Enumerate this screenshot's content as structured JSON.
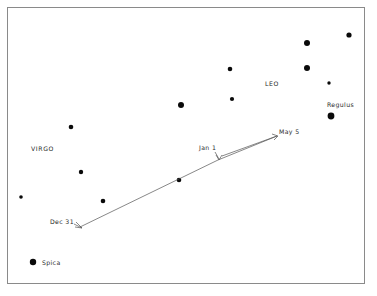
{
  "figure": {
    "background_color": "#ffffff",
    "frame_color": "#8a8a8a",
    "star_color": "#0a0a0a",
    "path_color": "#555555",
    "label_color": "#2b2b2b"
  },
  "frame": {
    "x": 7.5,
    "y": 7.5,
    "width": 357,
    "height": 276
  },
  "constellations": [
    {
      "name": "LEO",
      "label": "LEO",
      "x": 265,
      "y": 86
    },
    {
      "name": "VIRGO",
      "label": "VIRGO",
      "x": 31,
      "y": 151
    }
  ],
  "named_stars": [
    {
      "name": "Regulus",
      "label": "Regulus",
      "label_x": 327,
      "label_y": 107,
      "x": 331,
      "y": 116,
      "r": 3.4
    },
    {
      "name": "Spica",
      "label": "Spica",
      "label_x": 42,
      "label_y": 265,
      "x": 33,
      "y": 262,
      "r": 3.2
    }
  ],
  "stars": [
    {
      "x": 331,
      "y": 116,
      "r": 3.4
    },
    {
      "x": 33,
      "y": 262,
      "r": 3.2
    },
    {
      "x": 307,
      "y": 43,
      "r": 3.0
    },
    {
      "x": 349,
      "y": 35,
      "r": 2.6
    },
    {
      "x": 307,
      "y": 68,
      "r": 3.0
    },
    {
      "x": 329,
      "y": 83,
      "r": 1.7
    },
    {
      "x": 230,
      "y": 69,
      "r": 2.3
    },
    {
      "x": 232,
      "y": 99,
      "r": 2.1
    },
    {
      "x": 181,
      "y": 105,
      "r": 3.0
    },
    {
      "x": 71,
      "y": 127,
      "r": 2.3
    },
    {
      "x": 81,
      "y": 172,
      "r": 2.2
    },
    {
      "x": 21,
      "y": 197,
      "r": 1.8
    },
    {
      "x": 103,
      "y": 201,
      "r": 2.3
    },
    {
      "x": 179,
      "y": 180,
      "r": 2.3
    }
  ],
  "path": {
    "type": "retrograde-loop",
    "outbound": [
      {
        "x": 80,
        "y": 227
      },
      {
        "x": 218,
        "y": 160
      },
      {
        "x": 277,
        "y": 136
      }
    ],
    "return": [
      {
        "x": 277,
        "y": 136
      },
      {
        "x": 222,
        "y": 156
      }
    ]
  },
  "date_markers": [
    {
      "name": "dec-31",
      "label": "Dec 31",
      "label_x": 50,
      "label_y": 224,
      "point_x": 80,
      "point_y": 227
    },
    {
      "name": "jan-1",
      "label": "Jan 1",
      "label_x": 199,
      "label_y": 150,
      "point_x": 219,
      "point_y": 159
    },
    {
      "name": "may-5",
      "label": "May 5",
      "label_x": 279,
      "label_y": 134,
      "point_x": 277,
      "point_y": 136
    }
  ]
}
